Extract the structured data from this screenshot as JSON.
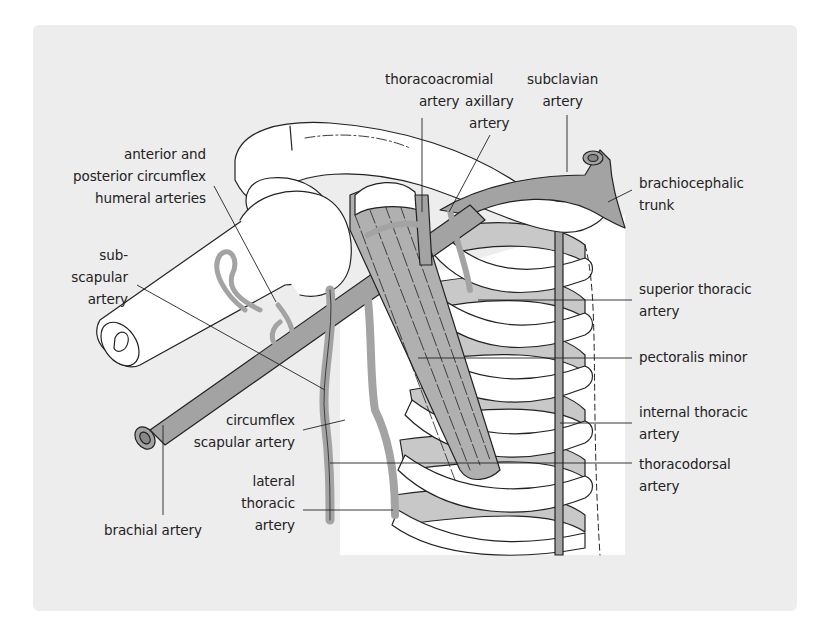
{
  "figure": {
    "type": "anatomical-illustration",
    "colors": {
      "panel_background": "#ededed",
      "artery_fill": "#a3a3a3",
      "muscle_fill": "#b0b0b0",
      "bone_fill": "#ffffff",
      "rib_shadow_fill": "#c8c8c8",
      "outline": "#222222",
      "label_text": "#222222"
    }
  },
  "labels": {
    "thoracoacromial": {
      "line1": "thoracoacromial",
      "line2": "artery"
    },
    "axillary": {
      "line1": "axillary",
      "line2": "artery"
    },
    "subclavian": {
      "line1": "subclavian",
      "line2": "artery"
    },
    "circumflex_humeral": {
      "line1": "anterior and",
      "line2": "posterior circumflex",
      "line3": "humeral arteries"
    },
    "brachiocephalic": {
      "line1": "brachiocephalic",
      "line2": "trunk"
    },
    "subscapular": {
      "line1": "sub-",
      "line2": "scapular",
      "line3": "artery"
    },
    "superior_thoracic": {
      "line1": "superior thoracic",
      "line2": "artery"
    },
    "pectoralis_minor": {
      "line1": "pectoralis minor"
    },
    "internal_thoracic": {
      "line1": "internal thoracic",
      "line2": "artery"
    },
    "circumflex_scapular": {
      "line1": "circumflex",
      "line2": "scapular artery"
    },
    "thoracodorsal": {
      "line1": "thoracodorsal",
      "line2": "artery"
    },
    "lateral_thoracic": {
      "line1": "lateral",
      "line2": "thoracic",
      "line3": "artery"
    },
    "brachial": {
      "line1": "brachial artery"
    }
  }
}
